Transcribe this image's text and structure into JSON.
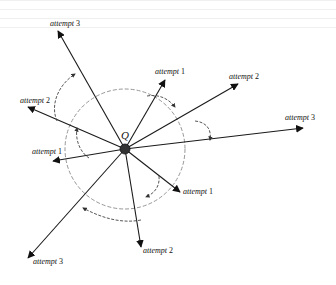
{
  "diagram": {
    "center": {
      "label": "Q",
      "x": 125,
      "y": 149,
      "radius": 5,
      "fill": "#333333"
    },
    "guide_circle": {
      "cx": 125,
      "cy": 149,
      "r": 60,
      "style": "dashed",
      "color": "#888888"
    },
    "rays": [
      {
        "id": "ray-attempt-3-top-left",
        "label": "attempt",
        "num": "3",
        "tip_x": 58,
        "tip_y": 31,
        "label_x": 50,
        "label_y": 20
      },
      {
        "id": "ray-attempt-1-upper",
        "label": "attempt",
        "num": "1",
        "tip_x": 165,
        "tip_y": 80,
        "label_x": 155,
        "label_y": 68
      },
      {
        "id": "ray-attempt-2-upper-right",
        "label": "attempt",
        "num": "2",
        "tip_x": 238,
        "tip_y": 84,
        "label_x": 229,
        "label_y": 73
      },
      {
        "id": "ray-attempt-3-right",
        "label": "attempt",
        "num": "3",
        "tip_x": 303,
        "tip_y": 128,
        "label_x": 285,
        "label_y": 114
      },
      {
        "id": "ray-attempt-2-left",
        "label": "attempt",
        "num": "2",
        "tip_x": 28,
        "tip_y": 107,
        "label_x": 20,
        "label_y": 97
      },
      {
        "id": "ray-attempt-1-left",
        "label": "attempt",
        "num": "1",
        "tip_x": 53,
        "tip_y": 161,
        "label_x": 32,
        "label_y": 148
      },
      {
        "id": "ray-attempt-1-lower-right",
        "label": "attempt",
        "num": "1",
        "tip_x": 180,
        "tip_y": 192,
        "label_x": 183,
        "label_y": 188
      },
      {
        "id": "ray-attempt-2-bottom",
        "label": "attempt",
        "num": "2",
        "tip_x": 141,
        "tip_y": 247,
        "label_x": 143,
        "label_y": 247
      },
      {
        "id": "ray-attempt-3-bottom-left",
        "label": "attempt",
        "num": "3",
        "tip_x": 28,
        "tip_y": 258,
        "label_x": 33,
        "label_y": 258
      }
    ],
    "rotation_arrows": [
      {
        "id": "rot-left-2-to-top-3",
        "d": "M57,121 C50,105 58,85 75,74",
        "style": "dashed"
      },
      {
        "id": "rot-left-1-to-left-2",
        "d": "M89,158 C80,152 75,140 77,128",
        "style": "dashed"
      },
      {
        "id": "rot-upper-1-to-upper-2",
        "d": "M147,96 C158,94 168,98 175,107",
        "style": "dashed"
      },
      {
        "id": "rot-upper-2-to-right-3",
        "d": "M195,121 C205,122 212,128 210,140",
        "style": "dashed"
      },
      {
        "id": "rot-lower-right-to-bottom",
        "d": "M159,176 C160,186 155,193 146,197",
        "style": "dashed"
      },
      {
        "id": "rot-bottom-to-bottom-left",
        "d": "M141,220 C120,224 100,217 83,208",
        "style": "dashed"
      }
    ]
  }
}
